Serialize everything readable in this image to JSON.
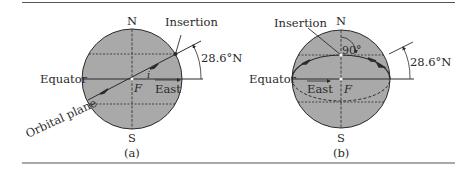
{
  "figure": {
    "panels": [
      {
        "id": "a",
        "caption": "(a)",
        "labels": {
          "north": "N",
          "south": "S",
          "equator": "Equator",
          "insertion": "Insertion",
          "latitude": "28.6°N",
          "focus": "F",
          "east": "East",
          "inclination": "i",
          "orbital_plane": "Orbital plane"
        }
      },
      {
        "id": "b",
        "caption": "(b)",
        "labels": {
          "north": "N",
          "south": "S",
          "equator": "Equator",
          "insertion": "Insertion",
          "latitude": "28.6°N",
          "focus": "F",
          "east": "East",
          "angle": "90°"
        }
      }
    ],
    "colors": {
      "sphere_fill": "#a9a9a9",
      "line": "#2b2b2b",
      "rule": "#555555",
      "background": "#ffffff"
    }
  }
}
